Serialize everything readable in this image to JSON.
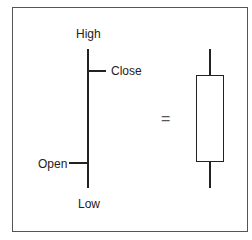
{
  "diagram": {
    "labels": {
      "high": "High",
      "close": "Close",
      "open": "Open",
      "low": "Low",
      "equals": "="
    }
  }
}
